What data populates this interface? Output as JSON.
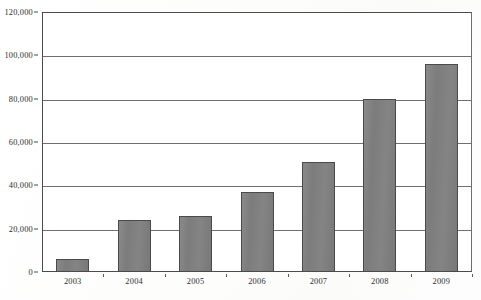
{
  "chart_data": {
    "type": "bar",
    "title": "",
    "subtitle": "",
    "xlabel": "",
    "ylabel": "",
    "categories": [
      "2003",
      "2004",
      "2005",
      "2006",
      "2007",
      "2008",
      "2009"
    ],
    "values": [
      6000,
      24000,
      26000,
      37000,
      51000,
      80000,
      96000
    ],
    "series": [
      {
        "name": "",
        "values": [
          6000,
          24000,
          26000,
          37000,
          51000,
          80000,
          96000
        ]
      }
    ],
    "ylim": [
      0,
      120000
    ],
    "y_ticks": [
      0,
      20000,
      40000,
      60000,
      80000,
      100000,
      120000
    ],
    "y_tick_labels": [
      "0",
      "20,000",
      "40,000",
      "60,000",
      "80,000",
      "100,000",
      "120,000"
    ],
    "x_tick_labels": [
      "2003",
      "2004",
      "2005",
      "2006",
      "2007",
      "2008",
      "2009"
    ],
    "grid": true,
    "grid_axis": "y",
    "legend": false,
    "legend_position": "none",
    "annotations": [],
    "bar_color": "#7e7e7e",
    "bar_edge_color": "#4a4a4a",
    "axis_color": "#4b4b4b",
    "grid_color": "#6f6f6f",
    "background_color": "#ffffff"
  }
}
